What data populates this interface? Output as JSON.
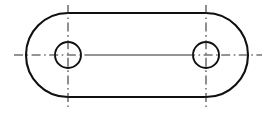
{
  "drawing": {
    "title": "Obround slotted plate with two through holes",
    "view": "front-view",
    "background_color": "#ffffff",
    "outline_color": "#101010",
    "centerline_color": "#2a2a2a",
    "canvas": {
      "width": 273,
      "height": 118
    },
    "outline": {
      "name": "obround-plate-outline",
      "shape": "obround",
      "left_center_x": 68,
      "right_center_x": 206,
      "center_y": 55,
      "top_y": 13,
      "bottom_y": 97,
      "left_extreme_x": 26,
      "right_extreme_x": 248,
      "corner_radius": 42
    },
    "holes": [
      {
        "name": "left-hole",
        "cx": 68,
        "cy": 55,
        "r": 13
      },
      {
        "name": "right-hole",
        "cx": 206,
        "cy": 55,
        "r": 13
      }
    ],
    "centerlines": {
      "horizontal": {
        "name": "horizontal-centerline",
        "y": 55,
        "start_x": 14,
        "end_x": 262,
        "inner_solid_start_x": 88,
        "inner_solid_end_x": 186
      },
      "vertical_left": {
        "name": "left-vertical-centerline",
        "x": 68,
        "start_y": 5,
        "end_y": 108
      },
      "vertical_right": {
        "name": "right-vertical-centerline",
        "x": 206,
        "start_y": 5,
        "end_y": 108
      }
    }
  }
}
